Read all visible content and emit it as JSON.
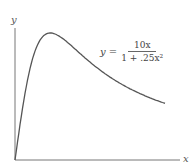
{
  "chart_data": {
    "type": "line",
    "title": "",
    "xlabel": "x",
    "ylabel": "y",
    "annotation": {
      "lhs": "y =",
      "numerator": "10x",
      "denominator": "1 + .25x²"
    },
    "function": "y = 10x / (1 + 0.25x^2)",
    "xlim": [
      0,
      8.5
    ],
    "ylim": [
      0,
      5.5
    ],
    "grid": false,
    "legend": "none",
    "x": [
      0,
      0.5,
      1,
      1.5,
      2,
      2.5,
      3,
      3.5,
      4,
      5,
      6,
      7,
      8,
      8.5
    ],
    "values": [
      0,
      4.71,
      8.0,
      9.6,
      10.0,
      9.76,
      9.23,
      8.62,
      8.0,
      6.9,
      6.0,
      5.28,
      4.71,
      4.46
    ],
    "peak": {
      "x": 2,
      "y": 10
    }
  },
  "axes": {
    "x_label": "x",
    "y_label": "y"
  },
  "equation": {
    "lhs": "y =",
    "numerator": "10x",
    "denominator": "1 + .25x²"
  }
}
